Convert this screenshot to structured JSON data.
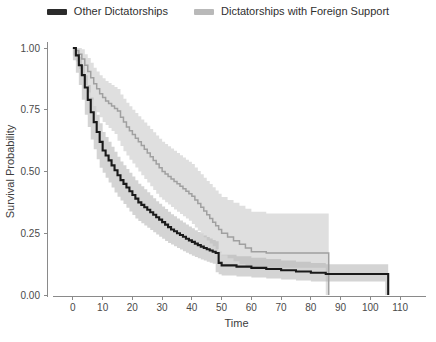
{
  "legend": {
    "position": "top-center",
    "items": [
      {
        "label": "Other Dictatorships",
        "color": "#2b2b2b",
        "swatch_name": "legend-swatch-other-dictatorships"
      },
      {
        "label": "Dictatorships with Foreign Support",
        "color": "#b9b9b9",
        "swatch_name": "legend-swatch-foreign-support"
      }
    ]
  },
  "chart_data": {
    "type": "line",
    "subtype": "kaplan-meier-survival-step",
    "title": "",
    "xlabel": "Time",
    "ylabel": "Survival Probability",
    "xlim": [
      -4,
      114
    ],
    "ylim": [
      0,
      1
    ],
    "grid": false,
    "legend_position": "top-center",
    "xticks": [
      0,
      10,
      20,
      30,
      40,
      50,
      60,
      70,
      80,
      90,
      100,
      110
    ],
    "xtick_labels": [
      "0",
      "10",
      "20",
      "30",
      "40",
      "50",
      "60",
      "70",
      "80",
      "90",
      "100",
      "110"
    ],
    "yticks": [
      0.0,
      0.25,
      0.5,
      0.75,
      1.0
    ],
    "ytick_labels": [
      "0.00",
      "0.25",
      "0.50",
      "0.75",
      "1.00"
    ],
    "series": [
      {
        "name": "Other Dictatorships",
        "color": "#1a1a1a",
        "band_color": "#b0b0b0",
        "band_opacity": 0.55,
        "x": [
          0,
          1,
          2,
          3,
          4,
          5,
          6,
          7,
          8,
          9,
          10,
          11,
          12,
          13,
          14,
          15,
          16,
          17,
          18,
          19,
          20,
          21,
          22,
          23,
          24,
          25,
          26,
          27,
          28,
          29,
          30,
          31,
          32,
          33,
          34,
          35,
          36,
          37,
          38,
          39,
          40,
          41,
          42,
          43,
          44,
          45,
          46,
          47,
          48,
          49,
          50,
          55,
          60,
          65,
          70,
          75,
          80,
          85,
          90,
          95,
          100,
          105,
          106
        ],
        "y": [
          1.0,
          0.97,
          0.93,
          0.89,
          0.84,
          0.79,
          0.74,
          0.7,
          0.66,
          0.62,
          0.585,
          0.565,
          0.545,
          0.525,
          0.505,
          0.485,
          0.465,
          0.45,
          0.435,
          0.42,
          0.405,
          0.39,
          0.375,
          0.365,
          0.355,
          0.345,
          0.335,
          0.325,
          0.315,
          0.305,
          0.295,
          0.285,
          0.275,
          0.265,
          0.258,
          0.25,
          0.243,
          0.236,
          0.228,
          0.221,
          0.215,
          0.208,
          0.202,
          0.196,
          0.19,
          0.185,
          0.18,
          0.175,
          0.17,
          0.13,
          0.12,
          0.115,
          0.11,
          0.105,
          0.1,
          0.095,
          0.09,
          0.085,
          0.085,
          0.085,
          0.085,
          0.085,
          0.0
        ],
        "band_lower": [
          1.0,
          0.95,
          0.9,
          0.85,
          0.79,
          0.73,
          0.68,
          0.63,
          0.59,
          0.55,
          0.515,
          0.495,
          0.475,
          0.455,
          0.435,
          0.415,
          0.398,
          0.383,
          0.368,
          0.353,
          0.338,
          0.324,
          0.31,
          0.3,
          0.29,
          0.281,
          0.272,
          0.263,
          0.254,
          0.245,
          0.236,
          0.228,
          0.219,
          0.211,
          0.204,
          0.197,
          0.19,
          0.184,
          0.177,
          0.171,
          0.165,
          0.159,
          0.154,
          0.149,
          0.144,
          0.14,
          0.135,
          0.131,
          0.127,
          0.092,
          0.084,
          0.079,
          0.075,
          0.071,
          0.067,
          0.063,
          0.059,
          0.055,
          0.055,
          0.055,
          0.055,
          0.055,
          0.0
        ],
        "band_upper": [
          1.0,
          0.99,
          0.965,
          0.93,
          0.89,
          0.85,
          0.8,
          0.765,
          0.73,
          0.695,
          0.66,
          0.64,
          0.62,
          0.6,
          0.58,
          0.56,
          0.54,
          0.525,
          0.51,
          0.495,
          0.48,
          0.465,
          0.45,
          0.44,
          0.428,
          0.416,
          0.404,
          0.392,
          0.38,
          0.369,
          0.358,
          0.348,
          0.337,
          0.327,
          0.319,
          0.31,
          0.302,
          0.294,
          0.285,
          0.277,
          0.27,
          0.262,
          0.255,
          0.248,
          0.241,
          0.235,
          0.229,
          0.223,
          0.218,
          0.175,
          0.163,
          0.157,
          0.151,
          0.146,
          0.14,
          0.135,
          0.13,
          0.125,
          0.125,
          0.125,
          0.125,
          0.125,
          0.0
        ]
      },
      {
        "name": "Dictatorships with Foreign Support",
        "color": "#a0a0a0",
        "band_color": "#dcdcdc",
        "band_opacity": 0.9,
        "x": [
          0,
          1,
          2,
          3,
          4,
          5,
          6,
          7,
          8,
          9,
          10,
          11,
          12,
          13,
          14,
          15,
          16,
          17,
          18,
          19,
          20,
          21,
          22,
          23,
          24,
          25,
          26,
          27,
          28,
          29,
          30,
          31,
          32,
          33,
          34,
          35,
          36,
          37,
          38,
          39,
          40,
          41,
          42,
          43,
          44,
          45,
          46,
          47,
          48,
          49,
          50,
          52,
          54,
          56,
          58,
          60,
          65,
          70,
          75,
          80,
          85,
          86
        ],
        "y": [
          1.0,
          0.99,
          0.975,
          0.955,
          0.93,
          0.905,
          0.88,
          0.855,
          0.835,
          0.815,
          0.8,
          0.785,
          0.775,
          0.765,
          0.755,
          0.745,
          0.72,
          0.7,
          0.68,
          0.665,
          0.65,
          0.635,
          0.62,
          0.605,
          0.59,
          0.575,
          0.56,
          0.545,
          0.53,
          0.515,
          0.5,
          0.49,
          0.48,
          0.47,
          0.46,
          0.45,
          0.44,
          0.43,
          0.42,
          0.41,
          0.4,
          0.385,
          0.37,
          0.355,
          0.34,
          0.325,
          0.31,
          0.295,
          0.28,
          0.265,
          0.25,
          0.235,
          0.22,
          0.205,
          0.19,
          0.175,
          0.17,
          0.17,
          0.17,
          0.17,
          0.17,
          0.0
        ],
        "band_lower": [
          1.0,
          0.97,
          0.945,
          0.915,
          0.885,
          0.85,
          0.82,
          0.79,
          0.765,
          0.74,
          0.72,
          0.7,
          0.688,
          0.676,
          0.664,
          0.652,
          0.625,
          0.603,
          0.582,
          0.565,
          0.548,
          0.532,
          0.516,
          0.5,
          0.485,
          0.47,
          0.455,
          0.44,
          0.425,
          0.41,
          0.396,
          0.386,
          0.376,
          0.366,
          0.356,
          0.346,
          0.337,
          0.328,
          0.319,
          0.31,
          0.301,
          0.287,
          0.273,
          0.26,
          0.247,
          0.234,
          0.221,
          0.209,
          0.197,
          0.185,
          0.173,
          0.161,
          0.149,
          0.137,
          0.126,
          0.115,
          0.11,
          0.11,
          0.11,
          0.11,
          0.11,
          0.0
        ],
        "band_upper": [
          1.0,
          1.0,
          1.0,
          0.995,
          0.975,
          0.96,
          0.94,
          0.92,
          0.905,
          0.89,
          0.878,
          0.866,
          0.858,
          0.85,
          0.842,
          0.834,
          0.812,
          0.795,
          0.778,
          0.764,
          0.75,
          0.737,
          0.724,
          0.711,
          0.698,
          0.685,
          0.672,
          0.659,
          0.646,
          0.633,
          0.62,
          0.611,
          0.602,
          0.593,
          0.584,
          0.575,
          0.566,
          0.557,
          0.548,
          0.539,
          0.53,
          0.516,
          0.502,
          0.489,
          0.475,
          0.462,
          0.449,
          0.436,
          0.423,
          0.41,
          0.397,
          0.385,
          0.373,
          0.361,
          0.349,
          0.337,
          0.33,
          0.33,
          0.33,
          0.33,
          0.33,
          0.0
        ]
      }
    ]
  }
}
